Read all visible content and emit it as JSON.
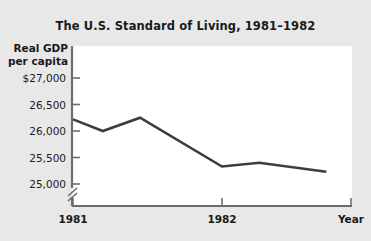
{
  "chart_data": {
    "type": "line",
    "title": "The U.S. Standard of Living, 1981–1982",
    "ylabel": "Real GDP\nper capita",
    "ylabel_line1": "Real GDP",
    "ylabel_line2": "per capita",
    "xlabel": "Year",
    "x_tick_labels": [
      "1981",
      "1982"
    ],
    "y_tick_labels": [
      "$27,000",
      "26,500",
      "26,000",
      "25,500",
      "25,000"
    ],
    "y_tick_values": [
      27000,
      26500,
      26000,
      25500,
      25000
    ],
    "ylim": [
      25000,
      27000
    ],
    "y_axis_break": true,
    "grid": false,
    "legend": false,
    "line_color": "#3d3d3d",
    "plot_background": "#ffffff",
    "figure_background": "#e8e8e8",
    "x": [
      1981.0,
      1981.2,
      1981.45,
      1982.0,
      1982.25,
      1982.7
    ],
    "values": [
      26220,
      26000,
      26250,
      25330,
      25400,
      25230
    ],
    "points": [
      {
        "x": 1981.0,
        "y": 26220
      },
      {
        "x": 1981.2,
        "y": 26000
      },
      {
        "x": 1981.45,
        "y": 26250
      },
      {
        "x": 1982.0,
        "y": 25330
      },
      {
        "x": 1982.25,
        "y": 25400
      },
      {
        "x": 1982.7,
        "y": 25230
      }
    ]
  },
  "chart": {
    "title": "The U.S. Standard of Living, 1981–1982",
    "ylabel_line1": "Real GDP",
    "ylabel_line2": "per capita",
    "xlabel": "Year",
    "ytick_0": "$27,000",
    "ytick_1": "26,500",
    "ytick_2": "26,000",
    "ytick_3": "25,500",
    "ytick_4": "25,000",
    "xtick_0": "1981",
    "xtick_1": "1982"
  }
}
